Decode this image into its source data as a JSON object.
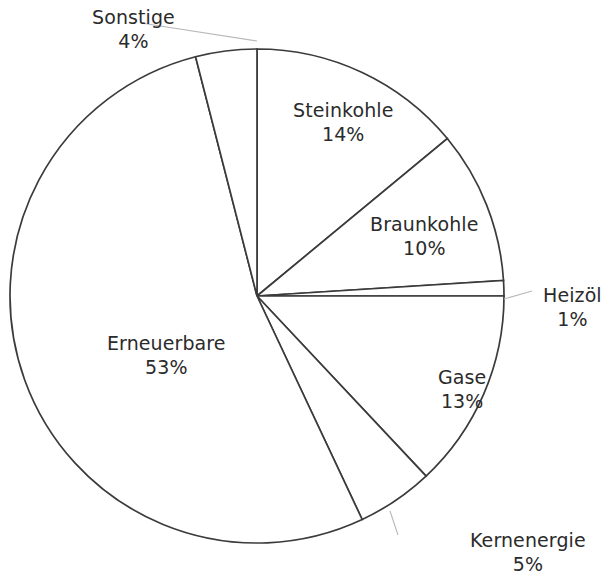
{
  "chart_data": {
    "type": "pie",
    "title": "",
    "subtitle": "",
    "unit": "%",
    "legend_position": "none",
    "grid": false,
    "start_angle_deg": 0,
    "direction": "clockwise",
    "categories": [
      "Steinkohle",
      "Braunkohle",
      "Heizöl",
      "Gase",
      "Kernenergie",
      "Erneuerbare",
      "Sonstige"
    ],
    "values": [
      14,
      10,
      1,
      13,
      5,
      53,
      4
    ],
    "labels": [
      "14%",
      "10%",
      "1%",
      "13%",
      "5%",
      "53%",
      "4%"
    ],
    "colors": [
      "#ffffff",
      "#ffffff",
      "#ffffff",
      "#ffffff",
      "#ffffff",
      "#ffffff",
      "#ffffff"
    ],
    "stroke_color": "#3b3b3b",
    "background_color": "#ffffff",
    "text_color": "#2b2b2b"
  },
  "slices": [
    {
      "id": "steinkohle",
      "name": "Steinkohle",
      "value": 14,
      "value_label": "14%",
      "label_x": 293,
      "label_y": 98,
      "inside": true,
      "has_leader": false
    },
    {
      "id": "braunkohle",
      "name": "Braunkohle",
      "value": 10,
      "value_label": "10%",
      "label_x": 370,
      "label_y": 212,
      "inside": true,
      "has_leader": false
    },
    {
      "id": "heizoel",
      "name": "Heizöl",
      "value": 1,
      "value_label": "1%",
      "label_x": 543,
      "label_y": 283,
      "inside": false,
      "has_leader": true
    },
    {
      "id": "gase",
      "name": "Gase",
      "value": 13,
      "value_label": "13%",
      "label_x": 438,
      "label_y": 365,
      "inside": true,
      "has_leader": false
    },
    {
      "id": "kernenergie",
      "name": "Kernenergie",
      "value": 5,
      "value_label": "5%",
      "label_x": 470,
      "label_y": 528,
      "inside": false,
      "has_leader": true
    },
    {
      "id": "erneuerbare",
      "name": "Erneuerbare",
      "value": 53,
      "value_label": "53%",
      "label_x": 107,
      "label_y": 331,
      "inside": true,
      "has_leader": false
    },
    {
      "id": "sonstige",
      "name": "Sonstige",
      "value": 4,
      "value_label": "4%",
      "label_x": 92,
      "label_y": 5,
      "inside": false,
      "has_leader": true
    }
  ],
  "geometry": {
    "center_x": 257,
    "center_y": 296,
    "radius": 247
  },
  "leaders": [
    {
      "id": "leader-sonstige",
      "d": "M 141 23 L 257 41"
    },
    {
      "id": "leader-heizoel",
      "d": "M 504 299 L 532 291"
    },
    {
      "id": "leader-kernenergie",
      "d": "M 390 511 L 398 535"
    }
  ]
}
